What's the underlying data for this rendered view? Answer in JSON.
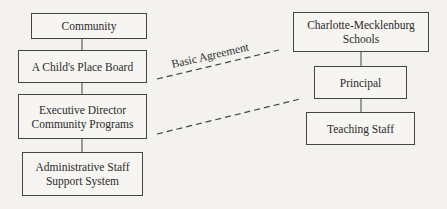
{
  "left_hierarchy": [
    {
      "id": "community",
      "lines": [
        "Community"
      ]
    },
    {
      "id": "board",
      "lines": [
        "A Child's Place Board"
      ]
    },
    {
      "id": "exec",
      "lines": [
        "Executive Director",
        "Community Programs"
      ]
    },
    {
      "id": "admin",
      "lines": [
        "Administrative Staff",
        "Support System"
      ]
    }
  ],
  "right_hierarchy": [
    {
      "id": "cms",
      "lines": [
        "Charlotte-Mecklenburg",
        "Schools"
      ]
    },
    {
      "id": "principal",
      "lines": [
        "Principal"
      ]
    },
    {
      "id": "teaching",
      "lines": [
        "Teaching Staff"
      ]
    }
  ],
  "connections": {
    "agreement_label": "Basic Agreement",
    "dashed_links": [
      {
        "from": "A Child's Place Board",
        "to": "Charlotte-Mecklenburg Schools"
      },
      {
        "from": "Executive Director Community Programs",
        "to": "Principal"
      }
    ]
  },
  "colors": {
    "line": "#444444",
    "background": "#f3f2ef"
  }
}
